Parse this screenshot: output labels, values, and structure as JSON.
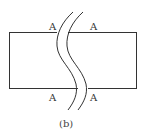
{
  "figure": {
    "caption": "(b)",
    "labels": {
      "top_left": "A",
      "top_right": "A",
      "bottom_left": "A",
      "bottom_right": "A"
    },
    "colors": {
      "stroke": "#333333",
      "background": "#ffffff"
    }
  }
}
